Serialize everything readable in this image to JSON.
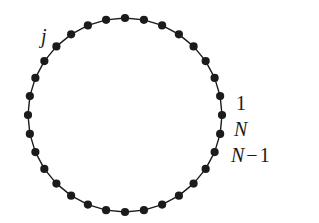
{
  "figure": {
    "type": "ring-lattice-diagram",
    "width": 319,
    "height": 223,
    "background_color": "#ffffff",
    "stroke_color": "#1b1b1b",
    "node_color": "#1b1b1b"
  },
  "ring": {
    "center_x": 125,
    "center_y": 115,
    "radius": 97,
    "node_count": 32,
    "node_radius": 4.1,
    "edge_width": 1.4,
    "start_angle_deg": -90
  },
  "labels": {
    "j": {
      "text": "j",
      "x": 41,
      "y": 26
    },
    "one": {
      "text": "1",
      "x": 236,
      "y": 93
    },
    "n": {
      "text": "N",
      "x": 234,
      "y": 119
    },
    "n_minus_1": {
      "symbol": "N",
      "operator": "−",
      "operand": "1",
      "x": 231,
      "y": 145
    }
  }
}
